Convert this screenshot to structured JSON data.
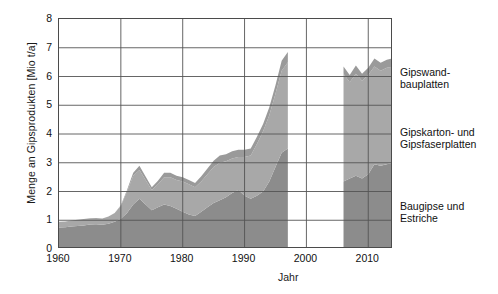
{
  "axes": {
    "ylabel": "Menge an Gipsprodukten [Mio t/a]",
    "xlabel": "Jahr",
    "yticks": [
      "8",
      "7",
      "6",
      "5",
      "4",
      "3",
      "2",
      "1",
      "0"
    ],
    "xticks": [
      "1960",
      "1970",
      "1980",
      "1990",
      "2000",
      "2010"
    ]
  },
  "legend": {
    "items": [
      {
        "line1": "Gipswand-",
        "line2": "bauplatten"
      },
      {
        "line1": "Gipskarton- und",
        "line2": "Gipsfaserplatten"
      },
      {
        "line1": "Baugipse und",
        "line2": "Estriche"
      }
    ]
  },
  "colors": {
    "band_bottom": "#8c8c8c",
    "band_middle": "#a8a8a8",
    "band_top": "#9a9a9a",
    "axis": "#4b4b4b",
    "grid": "#555555",
    "text": "#111111",
    "background": "#ffffff"
  },
  "chart_data": {
    "type": "area",
    "title": "",
    "xlabel": "Jahr",
    "ylabel": "Menge an Gipsprodukten [Mio t/a]",
    "xlim": [
      1960,
      2014
    ],
    "ylim": [
      0,
      8
    ],
    "grid": true,
    "stacked": true,
    "legend_position": "right",
    "note": "Stacked area chart with a data gap between 1997 and 2006",
    "x": [
      1960,
      1961,
      1962,
      1963,
      1964,
      1965,
      1966,
      1967,
      1968,
      1969,
      1970,
      1971,
      1972,
      1973,
      1974,
      1975,
      1976,
      1977,
      1978,
      1979,
      1980,
      1981,
      1982,
      1983,
      1984,
      1985,
      1986,
      1987,
      1988,
      1989,
      1990,
      1991,
      1992,
      1993,
      1994,
      1995,
      1996,
      1997,
      2006,
      2007,
      2008,
      2009,
      2010,
      2011,
      2012,
      2013,
      2014
    ],
    "series": [
      {
        "name": "Baugipse und Estriche",
        "values": [
          0.75,
          0.76,
          0.78,
          0.8,
          0.82,
          0.85,
          0.86,
          0.84,
          0.88,
          0.95,
          1.05,
          1.25,
          1.55,
          1.75,
          1.55,
          1.35,
          1.45,
          1.55,
          1.5,
          1.4,
          1.3,
          1.2,
          1.15,
          1.3,
          1.45,
          1.6,
          1.7,
          1.8,
          1.95,
          2.05,
          1.85,
          1.75,
          1.85,
          2.0,
          2.35,
          2.85,
          3.35,
          3.5,
          2.35,
          2.45,
          2.55,
          2.45,
          2.6,
          2.95,
          2.9,
          2.95,
          3.0
        ]
      },
      {
        "name": "Gipskarton- und Gipsfaserplatten",
        "values": [
          0.2,
          0.2,
          0.21,
          0.22,
          0.22,
          0.22,
          0.22,
          0.22,
          0.25,
          0.3,
          0.45,
          0.75,
          1.0,
          1.0,
          0.85,
          0.7,
          0.8,
          0.95,
          1.0,
          1.0,
          1.05,
          1.05,
          1.0,
          1.05,
          1.15,
          1.25,
          1.3,
          1.25,
          1.2,
          1.15,
          1.35,
          1.5,
          1.8,
          2.1,
          2.3,
          2.55,
          2.85,
          3.0,
          3.75,
          3.35,
          3.55,
          3.4,
          3.45,
          3.4,
          3.3,
          3.35,
          3.35
        ]
      },
      {
        "name": "Gipswandbauplatten",
        "values": [
          0.0,
          0.0,
          0.0,
          0.0,
          0.0,
          0.0,
          0.0,
          0.0,
          0.0,
          0.0,
          0.02,
          0.05,
          0.1,
          0.15,
          0.12,
          0.1,
          0.12,
          0.15,
          0.15,
          0.15,
          0.15,
          0.15,
          0.15,
          0.18,
          0.2,
          0.22,
          0.25,
          0.25,
          0.25,
          0.25,
          0.25,
          0.25,
          0.25,
          0.25,
          0.28,
          0.3,
          0.35,
          0.35,
          0.25,
          0.25,
          0.28,
          0.25,
          0.25,
          0.28,
          0.28,
          0.28,
          0.28
        ]
      }
    ]
  }
}
